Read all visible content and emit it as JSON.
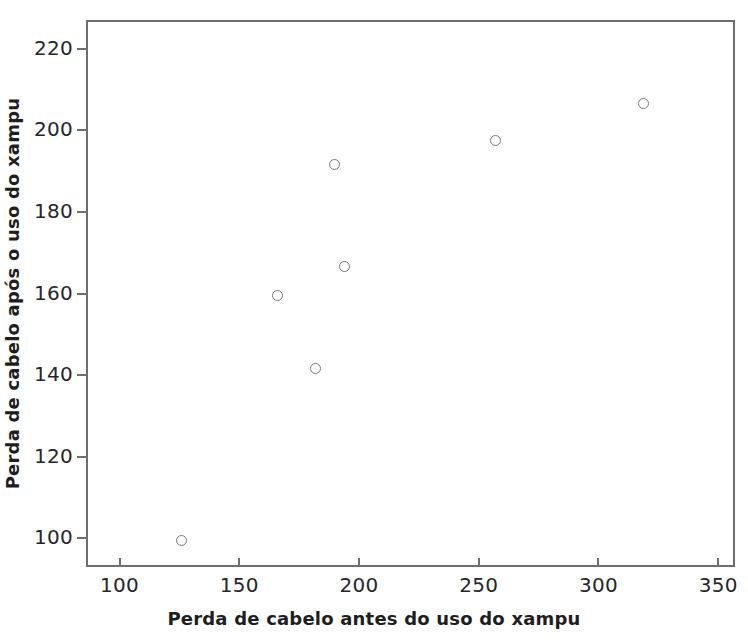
{
  "chart_data": {
    "type": "scatter",
    "title": "",
    "xlabel": "Perda de cabelo antes do uso do xampu",
    "ylabel": "Perda de cabelo após o uso do xampu",
    "xlim": [
      86,
      357
    ],
    "ylim": [
      93,
      227
    ],
    "xticks": [
      100,
      150,
      200,
      250,
      300,
      350
    ],
    "yticks": [
      100,
      120,
      140,
      160,
      180,
      200,
      220
    ],
    "xtick_labels": [
      "100",
      "150",
      "200",
      "250",
      "300",
      "350"
    ],
    "ytick_labels": [
      "100",
      "120",
      "140",
      "160",
      "180",
      "200",
      "220"
    ],
    "grid": false,
    "legend": null,
    "marker": "open-circle",
    "marker_color": "#77777d",
    "points": [
      {
        "x": 125,
        "y": 100
      },
      {
        "x": 165,
        "y": 160
      },
      {
        "x": 181,
        "y": 142
      },
      {
        "x": 189,
        "y": 192
      },
      {
        "x": 193,
        "y": 167
      },
      {
        "x": 256,
        "y": 198
      },
      {
        "x": 318,
        "y": 207
      }
    ]
  },
  "colors": {
    "axis": "#6e6e6e",
    "text": "#26262a",
    "title": "#1e1e22",
    "marker": "#77777d",
    "background": "#ffffff"
  }
}
